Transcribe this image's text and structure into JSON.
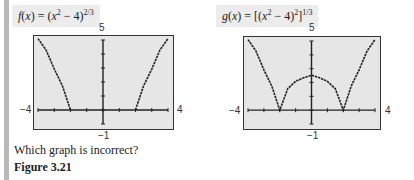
{
  "figure": {
    "question": "Which graph is incorrect?",
    "title": "Figure 3.21"
  },
  "graphs": [
    {
      "label_prefix": "f(x) = (x",
      "label_exp1": "2",
      "label_mid": " − 4)",
      "label_exp2": "2/3",
      "label_full": "f(x) = (x^2 − 4)^(2/3)",
      "ymax": "5",
      "ymin": "−1",
      "xmin": "−4",
      "xmax": "4"
    },
    {
      "label_prefix": "g(x) = [(x",
      "label_exp1": "2",
      "label_mid": " − 4)",
      "label_exp2a": "2",
      "label_close": "]",
      "label_exp2": "1/3",
      "label_full": "g(x) = [(x^2 − 4)^2]^(1/3)",
      "ymax": "5",
      "ymin": "−1",
      "xmin": "−4",
      "xmax": "4"
    }
  ],
  "chart_data": [
    {
      "type": "line",
      "title": "f(x) = (x^2 − 4)^(2/3)",
      "xlim": [
        -4,
        4
      ],
      "ylim": [
        -1,
        5
      ],
      "x_ticks_step": 1,
      "y_ticks_step": 1,
      "grid": false,
      "series": [
        {
          "name": "left branch",
          "x": [
            -4,
            -3.5,
            -3,
            -2.5,
            -2.0
          ],
          "y": [
            5.24,
            4.28,
            2.92,
            1.73,
            0.0
          ]
        },
        {
          "name": "right branch",
          "x": [
            2.0,
            2.5,
            3,
            3.5,
            4
          ],
          "y": [
            0.0,
            1.73,
            2.92,
            4.28,
            5.24
          ]
        }
      ],
      "note": "Calculator graph omits region -2 < x < 2"
    },
    {
      "type": "line",
      "title": "g(x) = [(x^2 − 4)^2]^(1/3)",
      "xlim": [
        -4,
        4
      ],
      "ylim": [
        -1,
        5
      ],
      "x_ticks_step": 1,
      "y_ticks_step": 1,
      "grid": false,
      "series": [
        {
          "name": "g(x)",
          "x": [
            -4,
            -3.5,
            -3,
            -2.5,
            -2,
            -1.5,
            -1,
            -0.5,
            0,
            0.5,
            1,
            1.5,
            2,
            2.5,
            3,
            3.5,
            4
          ],
          "y": [
            5.24,
            4.28,
            2.92,
            1.73,
            0.0,
            1.55,
            2.08,
            2.35,
            2.52,
            2.35,
            2.08,
            1.55,
            0.0,
            1.73,
            2.92,
            4.28,
            5.24
          ]
        }
      ]
    }
  ]
}
